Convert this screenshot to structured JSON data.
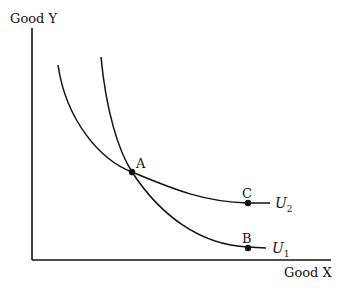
{
  "diagram": {
    "type": "indifference-curves",
    "y_axis_label": "Good Y",
    "x_axis_label": "Good X",
    "points": [
      {
        "label": "A",
        "x": 132,
        "y": 172
      },
      {
        "label": "B",
        "x": 248,
        "y": 248
      },
      {
        "label": "C",
        "x": 248,
        "y": 203
      }
    ],
    "curves": [
      {
        "name": "U",
        "subscript": "1",
        "passes_through": [
          "A",
          "B"
        ]
      },
      {
        "name": "U",
        "subscript": "2",
        "passes_through": [
          "A",
          "C"
        ]
      }
    ],
    "colors": {
      "ink": "#111111",
      "background": "#ffffff"
    }
  }
}
